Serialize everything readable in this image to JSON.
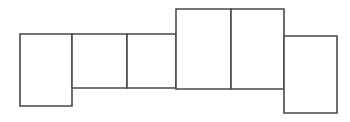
{
  "canvas": {
    "width": 350,
    "height": 122,
    "background_color": "#ffffff"
  },
  "diagram": {
    "name": "rectangle-net",
    "stroke_color": "#4a4a4a",
    "fill_color": "#ffffff",
    "stroke_width": 1.6,
    "shape_count": 6,
    "shapes": [
      {
        "id": "rect-1",
        "label": "",
        "x": 20,
        "y": 34,
        "width": 52,
        "height": 72
      },
      {
        "id": "rect-2",
        "label": "",
        "x": 72,
        "y": 34,
        "width": 55,
        "height": 54
      },
      {
        "id": "rect-3",
        "label": "",
        "x": 127,
        "y": 34,
        "width": 49,
        "height": 54
      },
      {
        "id": "rect-4",
        "label": "",
        "x": 176,
        "y": 9,
        "width": 55,
        "height": 80
      },
      {
        "id": "rect-5",
        "label": "",
        "x": 231,
        "y": 9,
        "width": 53,
        "height": 80
      },
      {
        "id": "rect-6",
        "label": "",
        "x": 284,
        "y": 36,
        "width": 53,
        "height": 77
      }
    ]
  }
}
